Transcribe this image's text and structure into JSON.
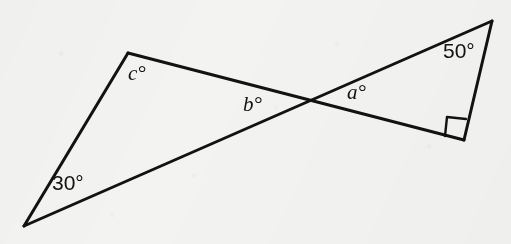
{
  "figure": {
    "kind": "geometry-diagram",
    "width": 511,
    "height": 244,
    "background_color": "#f3f3f1",
    "stroke_color": "#121212",
    "stroke_width": 3
  },
  "points": {
    "bottom_left": {
      "x": 24,
      "y": 226
    },
    "left_apex": {
      "x": 128,
      "y": 53
    },
    "crossing": {
      "x": 310,
      "y": 101
    },
    "top_right": {
      "x": 492,
      "y": 21
    },
    "right_angle_vertex": {
      "x": 464,
      "y": 140
    }
  },
  "segments": [
    {
      "name": "left-triangle-left-side",
      "from": "bottom_left",
      "to": "left_apex"
    },
    {
      "name": "long-line-bottom-left-to-top-right",
      "from": "bottom_left",
      "to": "top_right"
    },
    {
      "name": "long-line-left-apex-to-right-angle-vertex",
      "from": "left_apex",
      "to": "right_angle_vertex"
    },
    {
      "name": "right-triangle-right-side",
      "from": "top_right",
      "to": "right_angle_vertex"
    }
  ],
  "labels": [
    {
      "id": "angle-30",
      "text": "30°",
      "style": "numeric",
      "x": 52,
      "y": 172
    },
    {
      "id": "angle-c",
      "text": "c°",
      "style": "variable",
      "x": 128,
      "y": 63
    },
    {
      "id": "angle-b",
      "text": "b°",
      "style": "variable",
      "x": 243,
      "y": 94
    },
    {
      "id": "angle-a",
      "text": "a°",
      "style": "variable",
      "x": 347,
      "y": 82
    },
    {
      "id": "angle-50",
      "text": "50°",
      "style": "numeric",
      "x": 443,
      "y": 40
    }
  ],
  "right_angle_marker": {
    "name": "right-angle-square",
    "vertex": {
      "x": 464,
      "y": 140
    },
    "size": 21,
    "points": "445,136 447,117 466,119"
  },
  "chart_data": {
    "type": "diagram",
    "title": "",
    "known_angles": [
      {
        "label": "30°",
        "value": 30,
        "at": "bottom_left"
      },
      {
        "label": "50°",
        "value": 50,
        "at": "top_right"
      },
      {
        "label": "right angle",
        "value": 90,
        "at": "right_angle_vertex"
      }
    ],
    "unknown_angles": [
      {
        "label": "a°",
        "at": "crossing",
        "triangle": "right"
      },
      {
        "label": "b°",
        "at": "crossing",
        "triangle": "left"
      },
      {
        "label": "c°",
        "at": "left_apex",
        "triangle": "left"
      }
    ]
  }
}
